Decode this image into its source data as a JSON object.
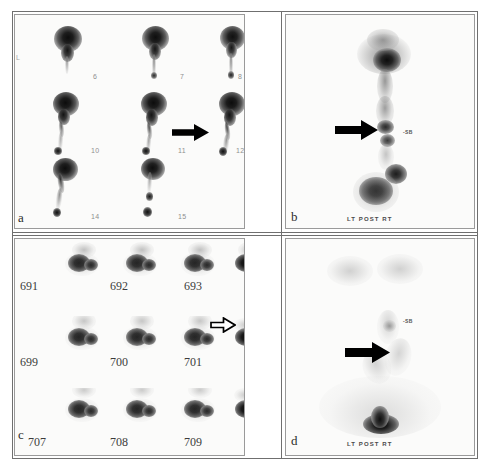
{
  "figure": {
    "kind": "nuclear-medicine-scintigraphy-composite"
  },
  "panels": [
    {
      "id": "a",
      "letter": "a",
      "type": "dynamic-frame-montage",
      "side_marker": "L",
      "rows": [
        {
          "frames": [
            "6",
            "7",
            "8"
          ]
        },
        {
          "frames": [
            "10",
            "11",
            "12"
          ]
        },
        {
          "frames": [
            "14",
            "15",
            ""
          ]
        }
      ],
      "arrow": {
        "style": "solid",
        "direction": "right",
        "points_to": "frame-12"
      }
    },
    {
      "id": "b",
      "letter": "b",
      "type": "static-posterior-image",
      "orientation_caption": "LT POST RT",
      "lesion_tag": "-SB",
      "arrow": {
        "style": "solid",
        "direction": "right",
        "points_to": "midline-focus"
      }
    },
    {
      "id": "c",
      "letter": "c",
      "type": "dynamic-frame-montage",
      "rows": [
        {
          "frames": [
            "691",
            "692",
            "693",
            "694"
          ]
        },
        {
          "frames": [
            "699",
            "700",
            "701",
            "702"
          ]
        },
        {
          "frames": [
            "707",
            "708",
            "709",
            "710"
          ]
        }
      ],
      "arrow": {
        "style": "open",
        "direction": "right",
        "points_to": "frame-702"
      }
    },
    {
      "id": "d",
      "letter": "d",
      "type": "static-posterior-image",
      "orientation_caption": "LT POST RT",
      "lesion_tag": "-SB",
      "arrow": {
        "style": "solid",
        "direction": "right",
        "points_to": "midline-focus"
      }
    }
  ],
  "colors": {
    "background": "#ffffff",
    "panel_background": "#fbfbfa",
    "rule": "#6f6f6f",
    "border": "#9a9a9a",
    "activity": "#1a1a1a",
    "label_faint": "#8f8f8f",
    "label_dark": "#3b3b3b"
  }
}
